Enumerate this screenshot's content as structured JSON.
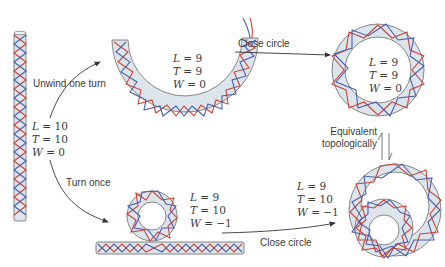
{
  "colors": {
    "strand_red": "#c8463c",
    "strand_blue": "#4a5fa8",
    "tube_fill": "#dde5ec",
    "tube_outline": "#6a6a6a",
    "text": "#3a3a3a",
    "arrow": "#333333"
  },
  "states": {
    "linear": {
      "L": "L = 10",
      "T": "T = 10",
      "W": "W = 0"
    },
    "unwound_arc": {
      "L": "L = 9",
      "T": "T = 9",
      "W": "W = 0"
    },
    "relaxed_circle": {
      "L": "L = 9",
      "T": "T = 9",
      "W": "W = 0"
    },
    "looped": {
      "L": "L = 9",
      "T": "T = 10",
      "W": "W = −1"
    },
    "supercoiled_circle": {
      "L": "L = 9",
      "T": "T = 10",
      "W": "W = −1"
    }
  },
  "arrows": {
    "unwind": "Unwind one turn",
    "turn": "Turn once",
    "close_top": "Close circle",
    "close_bottom": "Close circle",
    "equivalent_line1": "Equivalent",
    "equivalent_line2": "topologically"
  }
}
